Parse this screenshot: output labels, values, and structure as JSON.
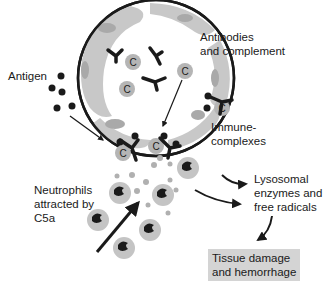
{
  "labels": {
    "antigen": "Antigen",
    "antibodies_line1": "Antibodies",
    "antibodies_line2": "and complement",
    "immune_line1": "Immune-",
    "immune_line2": "complexes",
    "neutrophils_line1": "Neutrophils",
    "neutrophils_line2": "attracted by",
    "neutrophils_line3": "C5a",
    "lysosomal_line1": "Lysosomal",
    "lysosomal_line2": "enzymes and",
    "lysosomal_line3": "free radicals",
    "tissue_line1": "Tissue damage",
    "tissue_line2": "and hemorrhage",
    "complement_symbol": "C"
  },
  "colors": {
    "vessel_wall": "#c8c8c8",
    "nucleus": "#a9a9a9",
    "outline": "#1a1a1a",
    "complement_fill": "#b5b5b5",
    "neutrophil_fill": "#c4c4c4",
    "outcome_box": "#d4d4d4"
  }
}
